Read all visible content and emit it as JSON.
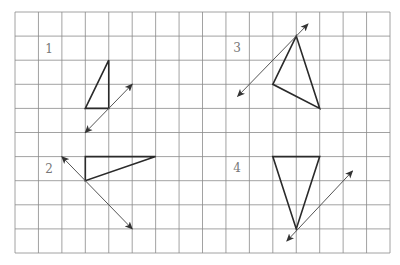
{
  "grid": {
    "left": 15,
    "top": 12,
    "right": 390,
    "bottom": 253,
    "columns": 16,
    "rows": 10,
    "line_color": "#8a8a8a"
  },
  "figures": [
    {
      "label": "1",
      "label_pos": [
        49,
        53
      ],
      "triangle": [
        [
          3,
          4
        ],
        [
          4,
          2
        ],
        [
          4,
          4
        ]
      ],
      "line_of_symmetry": {
        "from": [
          5,
          3
        ],
        "to": [
          3,
          5
        ],
        "double_arrow": true
      }
    },
    {
      "label": "2",
      "label_pos": [
        49,
        173
      ],
      "triangle": [
        [
          3,
          6
        ],
        [
          6,
          6
        ],
        [
          3,
          7
        ]
      ],
      "line_of_symmetry": {
        "from": [
          2,
          6
        ],
        "to": [
          5,
          9
        ],
        "double_arrow": true
      }
    },
    {
      "label": "3",
      "label_pos": [
        237,
        52
      ],
      "triangle": [
        [
          12,
          1
        ],
        [
          11,
          3
        ],
        [
          13,
          4
        ]
      ],
      "line_of_symmetry": {
        "from": [
          12.5,
          0.5
        ],
        "to": [
          9.5,
          3.5
        ],
        "double_arrow": true
      }
    },
    {
      "label": "4",
      "label_pos": [
        237,
        172
      ],
      "triangle": [
        [
          11,
          6
        ],
        [
          13,
          6
        ],
        [
          12,
          9
        ]
      ],
      "line_of_symmetry": {
        "from": [
          14.4,
          6.6
        ],
        "to": [
          11.6,
          9.5
        ],
        "double_arrow": true
      }
    }
  ],
  "colors": {
    "shape_stroke": "#2a2a2a",
    "arrow_stroke": "#555555",
    "label_color": "#777777"
  }
}
